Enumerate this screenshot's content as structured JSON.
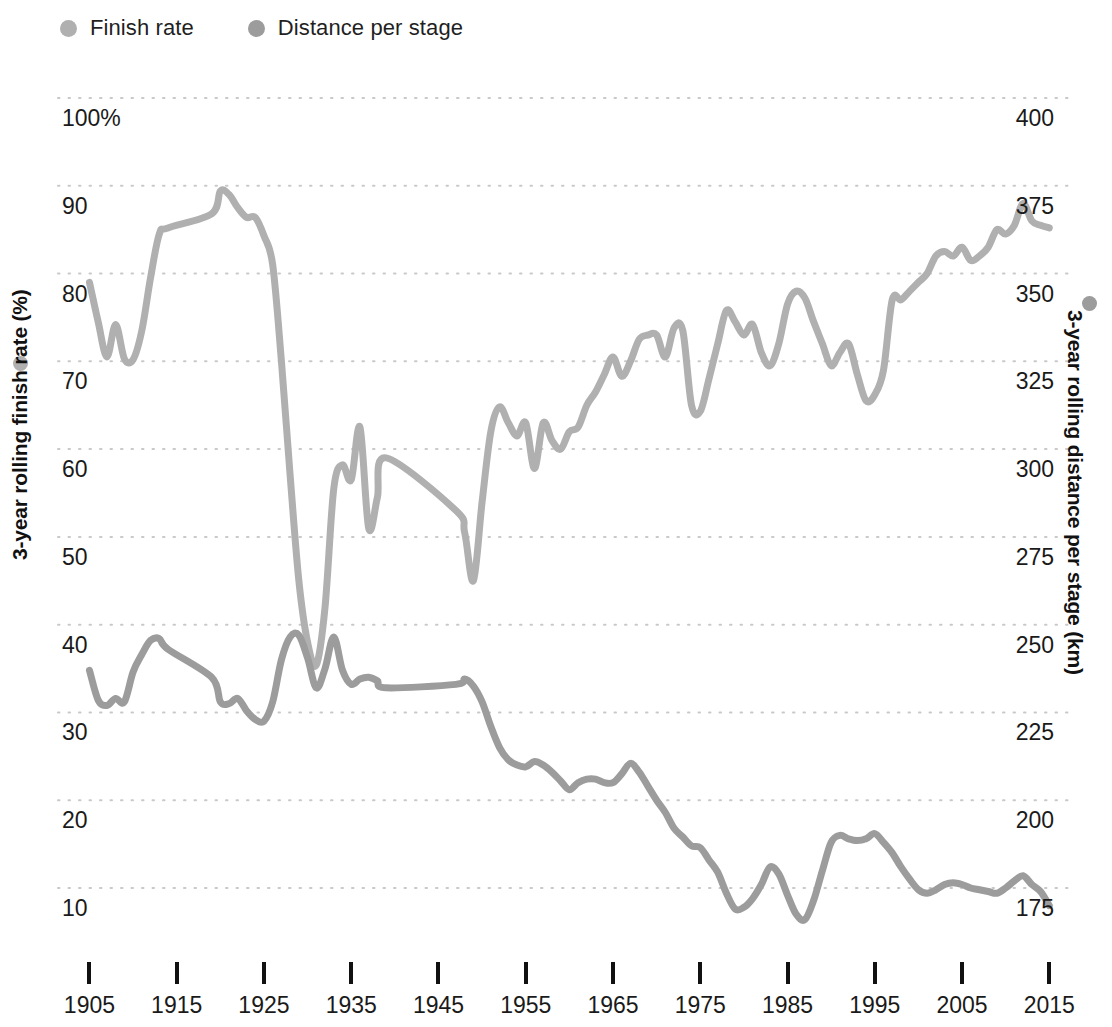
{
  "legend": {
    "items": [
      {
        "label": "Finish rate",
        "color": "#b0b0b0",
        "icon": "legend-dot-icon"
      },
      {
        "label": "Distance per stage",
        "color": "#9c9c9c",
        "icon": "legend-dot-icon"
      }
    ]
  },
  "axis_titles": {
    "left": "3-year rolling finish rate (%)",
    "right": "3-year rolling distance per stage (km)"
  },
  "chart_data": {
    "type": "line",
    "title": "",
    "subtitle": "",
    "xlabel": "",
    "grid": true,
    "grid_style": "dotted-horizontal",
    "legend_position": "top-left",
    "x": [
      1905,
      1906,
      1907,
      1908,
      1909,
      1910,
      1911,
      1912,
      1913,
      1914,
      1919,
      1920,
      1921,
      1922,
      1923,
      1924,
      1925,
      1926,
      1927,
      1928,
      1929,
      1930,
      1931,
      1932,
      1933,
      1934,
      1935,
      1936,
      1937,
      1938,
      1939,
      1947,
      1948,
      1949,
      1950,
      1951,
      1952,
      1953,
      1954,
      1955,
      1956,
      1957,
      1958,
      1959,
      1960,
      1961,
      1962,
      1963,
      1964,
      1965,
      1966,
      1967,
      1968,
      1969,
      1970,
      1971,
      1972,
      1973,
      1974,
      1975,
      1976,
      1977,
      1978,
      1979,
      1980,
      1981,
      1982,
      1983,
      1984,
      1985,
      1986,
      1987,
      1988,
      1989,
      1990,
      1991,
      1992,
      1993,
      1994,
      1995,
      1996,
      1997,
      1998,
      1999,
      2000,
      2001,
      2002,
      2003,
      2004,
      2005,
      2006,
      2007,
      2008,
      2009,
      2010,
      2011,
      2012,
      2013,
      2014,
      2015
    ],
    "x_tick_labels": [
      "1905",
      "1915",
      "1925",
      "1935",
      "1945",
      "1955",
      "1965",
      "1975",
      "1985",
      "1995",
      "2005",
      "2015"
    ],
    "x_tick_values": [
      1905,
      1915,
      1925,
      1935,
      1945,
      1955,
      1965,
      1975,
      1985,
      1995,
      2005,
      2015
    ],
    "xlim": [
      1903,
      2016
    ],
    "series": [
      {
        "name": "Finish rate",
        "axis": "left",
        "ylabel": "3-year rolling finish rate (%)",
        "unit": "%",
        "color": "#b0b0b0",
        "y_tick_labels": [
          "100%",
          "90",
          "80",
          "70",
          "60",
          "50",
          "40",
          "30",
          "20",
          "10"
        ],
        "y_tick_values": [
          100,
          90,
          80,
          70,
          60,
          50,
          40,
          30,
          20,
          10
        ],
        "ylim": [
          10,
          100
        ],
        "values": [
          79.0,
          74.5,
          70.5,
          74.2,
          70.3,
          70.2,
          73.5,
          79.5,
          84.5,
          85.2,
          86.8,
          89.4,
          89.0,
          87.5,
          86.4,
          86.4,
          84.3,
          81.0,
          70.0,
          57.0,
          45.0,
          38.0,
          35.4,
          42.0,
          55.5,
          58.2,
          56.5,
          62.5,
          51.0,
          54.5,
          59.0,
          53.0,
          50.5,
          45.0,
          54.0,
          62.0,
          64.8,
          63.0,
          61.5,
          63.0,
          57.8,
          63.0,
          61.0,
          60.0,
          62.0,
          62.5,
          65.0,
          66.5,
          68.5,
          70.5,
          68.3,
          70.0,
          72.5,
          73.0,
          73.0,
          70.5,
          73.8,
          73.5,
          65.0,
          64.3,
          68.0,
          72.0,
          75.8,
          74.5,
          73.0,
          74.2,
          71.0,
          69.5,
          72.0,
          76.5,
          78.0,
          77.2,
          74.5,
          72.0,
          69.5,
          71.0,
          72.0,
          68.5,
          65.5,
          66.2,
          69.0,
          77.0,
          77.0,
          78.0,
          79.0,
          80.0,
          82.0,
          82.5,
          82.0,
          83.0,
          81.5,
          82.0,
          83.0,
          85.0,
          84.5,
          85.5,
          88.0,
          86.0,
          85.5,
          85.2
        ]
      },
      {
        "name": "Distance per stage",
        "axis": "right",
        "ylabel": "3-year rolling distance per stage (km)",
        "unit": "km",
        "color": "#9c9c9c",
        "y_tick_labels": [
          "400",
          "375",
          "350",
          "325",
          "300",
          "275",
          "250",
          "225",
          "200",
          "175"
        ],
        "y_tick_values": [
          400,
          375,
          350,
          325,
          300,
          275,
          250,
          225,
          200,
          175
        ],
        "ylim": [
          175,
          400
        ],
        "values": [
          237.0,
          228.5,
          227.0,
          229.0,
          228.0,
          236.5,
          241.5,
          245.5,
          246.0,
          243.0,
          235.0,
          228.0,
          227.5,
          229.0,
          225.5,
          223.0,
          222.5,
          228.0,
          240.0,
          246.5,
          247.0,
          240.5,
          232.0,
          237.5,
          246.5,
          237.0,
          233.0,
          234.5,
          235.0,
          234.0,
          232.0,
          233.0,
          234.5,
          232.5,
          228.0,
          221.0,
          215.0,
          211.5,
          210.0,
          209.5,
          211.0,
          210.0,
          208.0,
          205.5,
          203.0,
          205.0,
          206.0,
          206.0,
          205.0,
          205.0,
          207.5,
          210.5,
          208.0,
          204.0,
          200.0,
          196.5,
          192.0,
          189.5,
          187.0,
          186.5,
          183.0,
          179.5,
          173.5,
          169.0,
          169.5,
          172.0,
          176.0,
          181.0,
          179.0,
          173.0,
          167.5,
          166.0,
          171.5,
          180.0,
          188.0,
          190.0,
          189.0,
          188.5,
          189.0,
          190.5,
          188.0,
          185.0,
          181.0,
          177.5,
          174.5,
          173.5,
          174.5,
          176.0,
          176.5,
          176.0,
          175.0,
          174.5,
          174.0,
          173.5,
          175.0,
          177.0,
          178.5,
          176.0,
          174.0,
          170.0
        ]
      }
    ]
  }
}
